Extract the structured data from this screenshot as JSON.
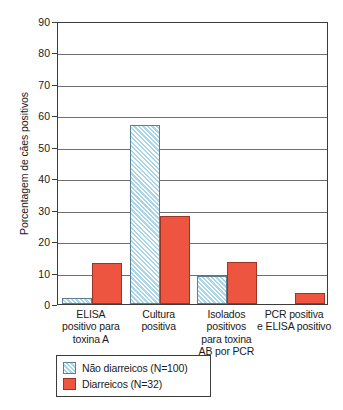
{
  "chart_data": {
    "type": "bar",
    "title": "",
    "xlabel": "",
    "ylabel": "Porcentagem de cães positivos",
    "ylim": [
      0,
      90
    ],
    "yticks": [
      0,
      10,
      20,
      30,
      40,
      50,
      60,
      70,
      80,
      90
    ],
    "ytick_labels": [
      "0",
      "10",
      "20",
      "30",
      "40",
      "50",
      "60",
      "70",
      "80",
      "90"
    ],
    "grid": true,
    "legend_position": "below-axes-left",
    "categories": [
      "ELISA positivo para toxina A",
      "Cultura positiva",
      "Isolados positivos para toxina AB por PCR",
      "PCR positiva e ELISA positivo"
    ],
    "category_lines": [
      [
        "ELISA",
        "positivo para",
        "toxina A"
      ],
      [
        "Cultura",
        "positiva"
      ],
      [
        "Isolados",
        "positivos",
        "para toxina",
        "AB por PCR"
      ],
      [
        "PCR positiva",
        "e ELISA positivo"
      ]
    ],
    "series": [
      {
        "name": "Não diarreicos (N=100)",
        "color": "#a9d6ea",
        "fill": "hatched",
        "values": [
          2,
          57,
          9,
          0
        ]
      },
      {
        "name": "Diarreicos (N=32)",
        "color": "#ee5540",
        "fill": "solid",
        "values": [
          13,
          28,
          13.5,
          3.5
        ]
      }
    ]
  },
  "legend": {
    "items": [
      {
        "label": "Não diarreicos (N=100)",
        "swatch": "hatched-blue"
      },
      {
        "label": "Diarreicos (N=32)",
        "swatch": "solid-red"
      }
    ]
  }
}
